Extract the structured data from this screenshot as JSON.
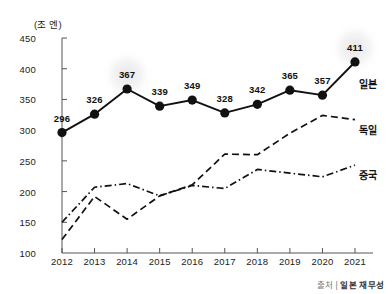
{
  "chart_data": {
    "type": "line",
    "title": "",
    "subtitle": "",
    "xlabel": "",
    "ylabel": "",
    "unit_label": "(조 엔)",
    "categories": [
      "2012",
      "2013",
      "2014",
      "2015",
      "2016",
      "2017",
      "2018",
      "2019",
      "2020",
      "2021"
    ],
    "ylim": [
      100,
      450
    ],
    "yticks": [
      450,
      400,
      350,
      300,
      250,
      200,
      150,
      100
    ],
    "grid": false,
    "legend_position": "right-inline",
    "series": [
      {
        "name": "일본",
        "style": "solid",
        "markers": true,
        "labels_shown": true,
        "values": [
          296,
          326,
          367,
          339,
          349,
          328,
          342,
          365,
          357,
          411
        ]
      },
      {
        "name": "독일",
        "style": "dashed",
        "markers": false,
        "labels_shown": false,
        "values": [
          122,
          192,
          155,
          193,
          211,
          261,
          260,
          295,
          324,
          317
        ]
      },
      {
        "name": "중국",
        "style": "dash-dot",
        "markers": false,
        "labels_shown": false,
        "values": [
          150,
          207,
          213,
          193,
          210,
          205,
          236,
          230,
          224,
          243
        ]
      }
    ],
    "highlighted_points": [
      {
        "series": "일본",
        "category": "2014",
        "value": 367
      },
      {
        "series": "일본",
        "category": "2021",
        "value": 411
      }
    ],
    "annotations": {
      "source_prefix": "출처 |",
      "source": "일본 재무성"
    },
    "colors": {
      "line": "#111111",
      "marker": "#111111",
      "axis": "#555555",
      "text": "#222222",
      "glow": "#ededed",
      "background": "#ffffff"
    }
  }
}
